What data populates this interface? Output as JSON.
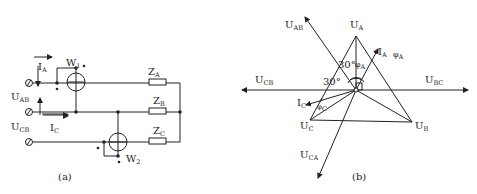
{
  "figure_a": {
    "caption": "(a)",
    "wattmeters": [
      {
        "name": "W",
        "sub": "1"
      },
      {
        "name": "W",
        "sub": "2"
      }
    ],
    "impedances": [
      {
        "name": "Z",
        "sub": "A"
      },
      {
        "name": "Z",
        "sub": "B"
      },
      {
        "name": "Z",
        "sub": "C"
      }
    ],
    "voltages": [
      {
        "name": "U",
        "sub": "AB"
      },
      {
        "name": "U",
        "sub": "CB"
      }
    ],
    "currents": [
      {
        "name": "I",
        "sub": "A"
      },
      {
        "name": "I",
        "sub": "C"
      }
    ]
  },
  "figure_b": {
    "caption": "(b)",
    "phase_voltages": [
      {
        "name": "U",
        "sub": "A"
      },
      {
        "name": "U",
        "sub": "B"
      },
      {
        "name": "U",
        "sub": "C"
      }
    ],
    "line_voltages": [
      {
        "name": "U",
        "sub": "AB"
      },
      {
        "name": "U",
        "sub": "CB"
      },
      {
        "name": "U",
        "sub": "BC"
      },
      {
        "name": "U",
        "sub": "CA"
      }
    ],
    "currents": [
      {
        "name": "I",
        "sub": "A"
      },
      {
        "name": "I",
        "sub": "C"
      }
    ],
    "angles": [
      {
        "text": "30°"
      },
      {
        "text": "30°"
      },
      {
        "name": "φ",
        "sub": "A"
      },
      {
        "name": "φ",
        "sub": "A"
      },
      {
        "name": "φ",
        "sub": "C"
      }
    ]
  }
}
